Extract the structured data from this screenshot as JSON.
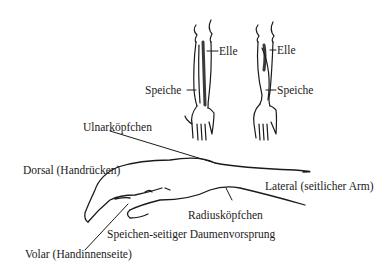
{
  "diagram": {
    "type": "anatomical-illustration",
    "top_figures": {
      "left_arm": {
        "labels": [
          "Elle",
          "Speiche"
        ]
      },
      "right_arm": {
        "labels": [
          "Elle",
          "Speiche"
        ]
      }
    },
    "labels": {
      "elle_left": "Elle",
      "speiche_left": "Speiche",
      "elle_right": "Elle",
      "speiche_right": "Speiche",
      "ulnarkoepfchen": "Ulnarköpfchen",
      "dorsal": "Dorsal (Handrücken)",
      "lateral": "Lateral (seitlicher Arm)",
      "radiuskoepfchen": "Radiusköpfchen",
      "daumenvorsprung": "Speichen-seitiger Daumenvorsprung",
      "volar": "Volar (Handinnenseite)"
    }
  }
}
